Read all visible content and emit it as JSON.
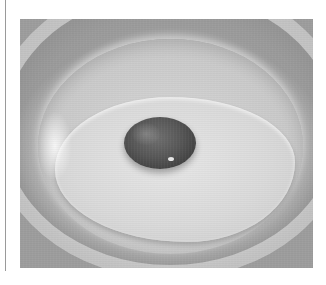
{
  "image": {
    "subject": "Raw egg with dark yolk on a white plate (grayscale photo)",
    "alt": "Egg on plate"
  },
  "colors": {
    "background": "#ffffff",
    "rule": "#9a9a9a",
    "plate": "#cfcfcf",
    "egg_white": "#dadada",
    "yolk": "#4a4a4a"
  }
}
